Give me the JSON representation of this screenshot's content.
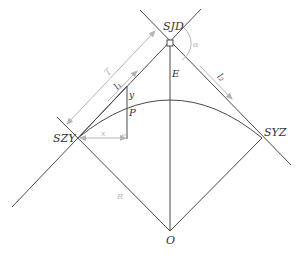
{
  "diagram": {
    "type": "circular curve geometry (route alignment)",
    "colors": {
      "line": "#4a4a4a",
      "dimension": "#b5b5b5",
      "background": "#ffffff"
    },
    "points": {
      "sjd": {
        "label": "SJD",
        "x": 170,
        "y": 42
      },
      "szy": {
        "label": "SZY",
        "x": 78,
        "y": 138
      },
      "syz": {
        "label": "SYZ",
        "x": 262,
        "y": 138
      },
      "o": {
        "label": "O",
        "x": 170,
        "y": 231
      },
      "p": {
        "label": "P",
        "x": 127,
        "y": 118
      }
    },
    "labels": {
      "sjd": "SJD",
      "szy": "SZY",
      "syz": "SYZ",
      "o": "O",
      "p": "P",
      "e": "E",
      "t": "T",
      "l1": "l₁",
      "l2": "l₂",
      "x": "x",
      "y": "y",
      "r": "R",
      "alpha": "α"
    }
  }
}
